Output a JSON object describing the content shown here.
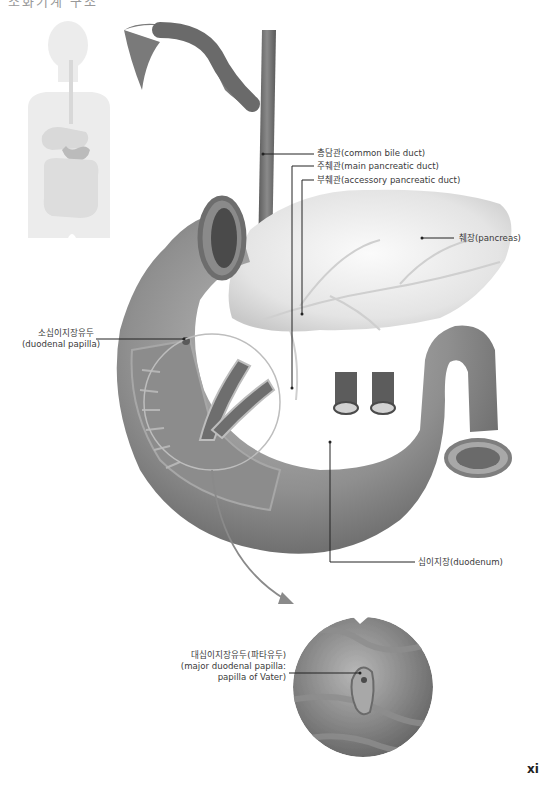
{
  "page": {
    "heading_clipped": "소화기계 구조",
    "page_number": "xi"
  },
  "labels": {
    "common_bile_duct": "총담관(common bile duct)",
    "main_pancreatic_duct": "주췌관(main pancreatic duct)",
    "accessory_pancreatic_duct": "부췌관(accessory pancreatic duct)",
    "pancreas": "췌장(pancreas)",
    "minor_papilla_ko": "소십이지장유두",
    "minor_papilla_en": "(duodenal papilla)",
    "duodenum": "십이지장(duodenum)",
    "major_papilla_ko": "대십이지장유두(파타유두)",
    "major_papilla_en1": "(major duodenal papilla:",
    "major_papilla_en2": "papilla of Vater)"
  },
  "colors": {
    "organ_dark": "#6e6e6e",
    "organ_mid": "#9a9a9a",
    "pancreas": "#e6e6e6",
    "silhouette": "#ececec",
    "leader_line": "#222222",
    "arrow": "#8a8a8a"
  }
}
